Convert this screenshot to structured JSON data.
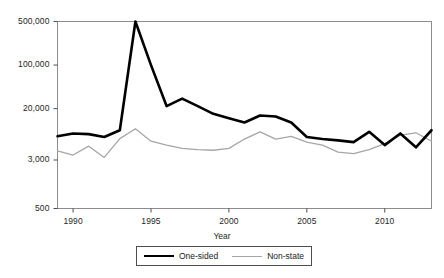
{
  "chart_data": {
    "type": "line",
    "title": "",
    "xlabel": "Year",
    "ylabel": "",
    "yscale": "log",
    "ylim": [
      500,
      500000
    ],
    "xlim": [
      1989,
      2013
    ],
    "grid": false,
    "legend_position": "bottom",
    "ytick_labels": [
      "500,000",
      "100,000",
      "20,000",
      "3,000",
      "500"
    ],
    "ytick_values": [
      500000,
      100000,
      20000,
      3000,
      500
    ],
    "xtick_labels": [
      "1990",
      "1995",
      "2000",
      "2005",
      "2010"
    ],
    "xtick_values": [
      1990,
      1995,
      2000,
      2005,
      2010
    ],
    "x": [
      1989,
      1990,
      1991,
      1992,
      1993,
      1994,
      1995,
      1996,
      1997,
      1998,
      1999,
      2000,
      2001,
      2002,
      2003,
      2004,
      2005,
      2006,
      2007,
      2008,
      2009,
      2010,
      2011,
      2012,
      2013
    ],
    "series": [
      {
        "name": "One-sided",
        "color": "#000000",
        "width": 2.6,
        "values": [
          7200,
          8000,
          7800,
          7000,
          9000,
          500000,
          100000,
          22000,
          29000,
          22000,
          16500,
          14000,
          12000,
          15500,
          15000,
          12000,
          7000,
          6500,
          6200,
          5800,
          8500,
          5200,
          8000,
          4800,
          9000
        ]
      },
      {
        "name": "Non-state",
        "color": "#a6a6a6",
        "width": 1.3,
        "values": [
          4200,
          3600,
          5000,
          3300,
          6600,
          9500,
          6000,
          5200,
          4600,
          4400,
          4300,
          4600,
          6500,
          8500,
          6500,
          7200,
          5800,
          5200,
          4000,
          3800,
          4400,
          5500,
          7500,
          8200,
          6000
        ]
      }
    ]
  },
  "axis": {
    "x_title": "Year"
  },
  "legend": {
    "entries": [
      {
        "label": "One-sided"
      },
      {
        "label": "Non-state"
      }
    ]
  }
}
